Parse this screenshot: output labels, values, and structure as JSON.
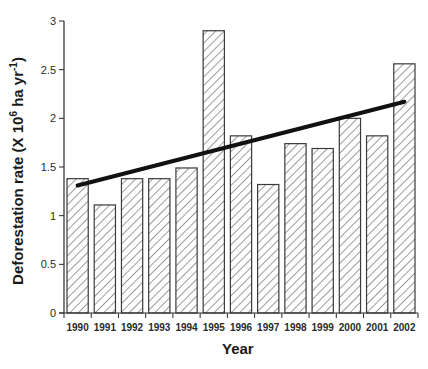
{
  "chart_data": {
    "type": "bar",
    "title": "",
    "xlabel": "Year",
    "ylabel": "Deforestation rate (X 10^6 ha yr^-1)",
    "ylabel_parts": {
      "prefix": "Deforestation rate (X 10",
      "sup1": "6",
      "mid": " ha yr",
      "sup2": "-1",
      "suffix": ")"
    },
    "ylim": [
      0,
      3
    ],
    "yticks": [
      0,
      0.5,
      1,
      1.5,
      2,
      2.5,
      3
    ],
    "ytick_labels": [
      "0",
      "0.5",
      "1",
      "1.5",
      "2",
      "2.5",
      "3"
    ],
    "grid": false,
    "legend": null,
    "bar_fill": "diagonal hatch",
    "categories": [
      "1990",
      "1991",
      "1992",
      "1993",
      "1994",
      "1995",
      "1996",
      "1997",
      "1998",
      "1999",
      "2000",
      "2001",
      "2002"
    ],
    "values": [
      1.38,
      1.11,
      1.38,
      1.38,
      1.49,
      2.9,
      1.82,
      1.32,
      1.74,
      1.69,
      2.0,
      1.82,
      2.56
    ],
    "trend_line": {
      "type": "linear",
      "start": {
        "x": "1990",
        "y": 1.31
      },
      "end": {
        "x": "2002",
        "y": 2.17
      },
      "color": "#111111"
    }
  },
  "colors": {
    "bar_stroke": "#3a3a3a",
    "hatch": "#3a3a3a",
    "axis": "#2a2a2a",
    "trend": "#111111"
  }
}
